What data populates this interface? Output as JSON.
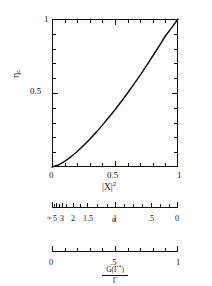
{
  "figure": {
    "title": "",
    "background": "#ffffff",
    "line_color": "#111111"
  },
  "main": {
    "ylabel": "η",
    "ylabel_sub": "c",
    "xlabel_base": "|X|",
    "xlabel_exp": "2",
    "ytick_labels": [
      "1",
      "0.5"
    ],
    "xtick_labels": [
      "0",
      "0.5",
      "1"
    ]
  },
  "aux_axis_1": {
    "name": "α",
    "labels": [
      "∞",
      "5",
      "3",
      "2",
      "1.5",
      "1",
      ".5",
      "0"
    ]
  },
  "aux_axis_2": {
    "numerator_a": "G(Γ",
    "numerator_sup": "*",
    "numerator_b": ")",
    "denominator": "Γ",
    "labels": [
      "0",
      ".5",
      "1"
    ]
  },
  "chart_data": {
    "type": "line",
    "title": "",
    "xlabel": "|X|^2",
    "ylabel": "η_c",
    "xlim": [
      0,
      1
    ],
    "ylim": [
      0,
      1
    ],
    "xticks": [
      0,
      0.5,
      1
    ],
    "yticks": [
      0,
      0.5,
      1
    ],
    "xtick_labels": [
      "0",
      "0.5",
      "1"
    ],
    "ytick_labels": [
      "0",
      "0.5",
      "1"
    ],
    "grid": false,
    "legend": "none",
    "series": [
      {
        "name": "eta_c vs |X|^2",
        "x": [
          0.0,
          0.05,
          0.1,
          0.15,
          0.2,
          0.25,
          0.3,
          0.35,
          0.4,
          0.45,
          0.5,
          0.55,
          0.6,
          0.65,
          0.7,
          0.75,
          0.8,
          0.85,
          0.9,
          0.95,
          1.0
        ],
        "y": [
          0.0,
          0.013,
          0.038,
          0.069,
          0.105,
          0.145,
          0.188,
          0.234,
          0.283,
          0.334,
          0.387,
          0.443,
          0.5,
          0.56,
          0.621,
          0.685,
          0.75,
          0.817,
          0.885,
          0.942,
          1.0
        ]
      }
    ],
    "aux_scale_alpha": {
      "description": "non-linear alpha scale beneath main x-axis",
      "tick_values": [
        "∞",
        "5",
        "3",
        "2",
        "1.5",
        "1",
        ".5",
        "0"
      ],
      "tick_positions": [
        0.0,
        0.028,
        0.075,
        0.17,
        0.28,
        0.5,
        0.79,
        1.0
      ]
    },
    "aux_scale_gamma": {
      "description": "linear G(Γ*)/Γ scale",
      "tick_values": [
        "0",
        ".5",
        "1"
      ],
      "tick_positions": [
        0.0,
        0.5,
        1.0
      ]
    }
  }
}
